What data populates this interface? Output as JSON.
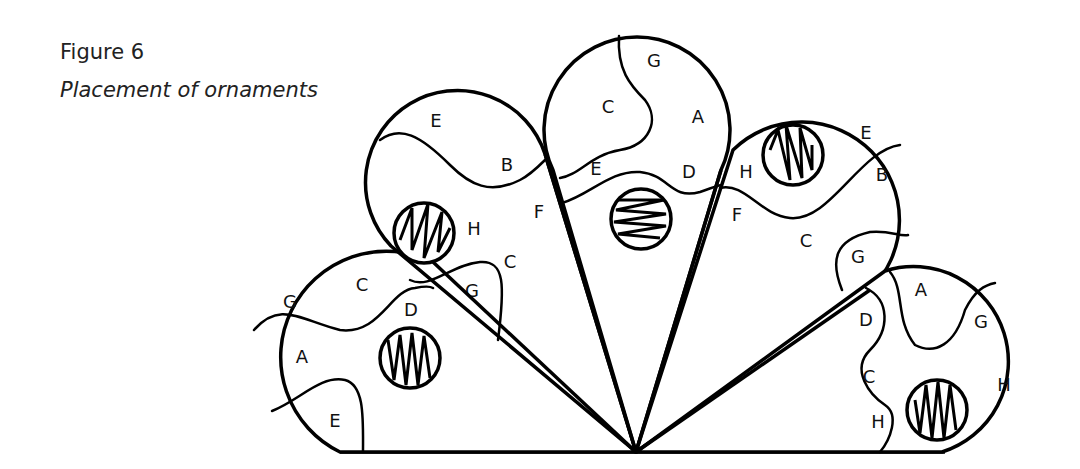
{
  "figure": {
    "number": "Figure 6",
    "title": "Placement of ornaments"
  },
  "lobes": [
    {
      "id": "left",
      "labels": [
        "G",
        "C",
        "D",
        "A",
        "E"
      ]
    },
    {
      "id": "upper-left",
      "labels": [
        "E",
        "B",
        "F",
        "H",
        "C",
        "G"
      ]
    },
    {
      "id": "top",
      "labels": [
        "G",
        "C",
        "A",
        "E",
        "D"
      ]
    },
    {
      "id": "upper-right",
      "labels": [
        "E",
        "B",
        "H",
        "F",
        "C",
        "G"
      ]
    },
    {
      "id": "right",
      "labels": [
        "A",
        "G",
        "D",
        "C",
        "H",
        "H"
      ]
    }
  ]
}
